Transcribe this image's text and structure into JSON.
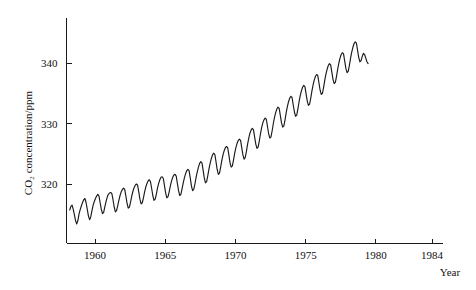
{
  "chart_data": {
    "type": "line",
    "title": "",
    "subtitle": "",
    "xlabel": "Year",
    "ylabel": "CO2 concentration/ppm",
    "ylabel_display": "CO₂ concentration/ppm",
    "xlim": [
      1958,
      1984.6
    ],
    "ylim": [
      313.2,
      345.4
    ],
    "grid": false,
    "legend": null,
    "x_ticks": [
      1960,
      1965,
      1970,
      1975,
      1980,
      1984
    ],
    "x_tick_labels": [
      "1960",
      "1965",
      "1970",
      "1975",
      "1980",
      "1984"
    ],
    "y_ticks": [
      320,
      330,
      340
    ],
    "y_tick_labels": [
      "320",
      "330",
      "340"
    ],
    "series": [
      {
        "name": "Mauna Loa monthly mean CO2",
        "x_start": 1958.2,
        "x_step": 0.0833333,
        "values": [
          315.7,
          316.3,
          316.5,
          315.8,
          314.9,
          313.9,
          313.4,
          314.0,
          315.1,
          315.8,
          316.4,
          317.0,
          317.4,
          317.6,
          316.9,
          315.8,
          314.7,
          314.1,
          314.6,
          315.6,
          316.5,
          317.1,
          317.6,
          318.0,
          318.3,
          318.0,
          316.9,
          315.8,
          315.1,
          315.3,
          316.2,
          317.1,
          317.8,
          318.3,
          318.5,
          318.6,
          318.4,
          317.4,
          316.2,
          315.4,
          315.6,
          316.4,
          317.3,
          318.1,
          318.7,
          319.1,
          319.3,
          319.1,
          318.0,
          316.8,
          316.0,
          316.2,
          317.0,
          318.0,
          318.8,
          319.4,
          319.8,
          320.0,
          319.8,
          318.7,
          317.5,
          316.7,
          316.9,
          317.7,
          318.7,
          319.5,
          320.1,
          320.5,
          320.7,
          320.4,
          319.3,
          318.1,
          317.3,
          317.5,
          318.3,
          319.3,
          320.1,
          320.7,
          321.1,
          321.2,
          320.9,
          319.7,
          318.5,
          317.7,
          317.9,
          318.7,
          319.7,
          320.5,
          321.1,
          321.5,
          321.6,
          321.3,
          320.1,
          318.9,
          318.1,
          318.3,
          319.2,
          320.2,
          321.0,
          321.7,
          322.2,
          322.4,
          322.2,
          321.0,
          319.7,
          318.9,
          319.1,
          320.0,
          321.1,
          322.0,
          322.8,
          323.4,
          323.7,
          323.5,
          322.3,
          321.0,
          320.2,
          320.4,
          321.4,
          322.5,
          323.4,
          324.2,
          324.8,
          325.1,
          324.9,
          323.7,
          322.4,
          321.6,
          321.8,
          322.8,
          323.9,
          324.8,
          325.5,
          326.0,
          326.2,
          326.0,
          324.8,
          323.5,
          322.8,
          323.0,
          324.0,
          325.1,
          326.0,
          326.7,
          327.2,
          327.4,
          327.2,
          326.0,
          324.8,
          324.1,
          324.4,
          325.4,
          326.6,
          327.6,
          328.4,
          328.9,
          329.2,
          329.0,
          327.8,
          326.6,
          325.9,
          326.1,
          327.1,
          328.3,
          329.3,
          330.1,
          330.6,
          330.9,
          330.7,
          329.5,
          328.3,
          327.6,
          327.8,
          328.8,
          330.0,
          331.0,
          331.8,
          332.4,
          332.7,
          332.5,
          331.3,
          330.1,
          329.4,
          329.6,
          330.6,
          331.8,
          332.8,
          333.6,
          334.2,
          334.5,
          334.3,
          333.1,
          331.9,
          331.2,
          331.4,
          332.4,
          333.6,
          334.6,
          335.4,
          336.0,
          336.3,
          336.1,
          334.9,
          333.7,
          333.0,
          333.2,
          334.2,
          335.4,
          336.4,
          337.2,
          337.8,
          338.1,
          337.9,
          336.7,
          335.5,
          334.8,
          335.0,
          336.0,
          337.2,
          338.2,
          339.0,
          339.6,
          339.9,
          339.7,
          338.5,
          337.3,
          336.6,
          336.8,
          337.8,
          339.0,
          340.0,
          340.8,
          341.4,
          341.7,
          341.5,
          340.3,
          339.1,
          338.4,
          338.6,
          339.6,
          340.8,
          341.8,
          342.6,
          343.2,
          343.5,
          343.3,
          342.1,
          340.9,
          340.2,
          340.4,
          341.1,
          341.6,
          341.4,
          340.8,
          340.2,
          339.9
        ]
      }
    ]
  },
  "axes": {
    "y_axis_label": "CO₂ concentration/ppm",
    "x_axis_label": "Year"
  }
}
